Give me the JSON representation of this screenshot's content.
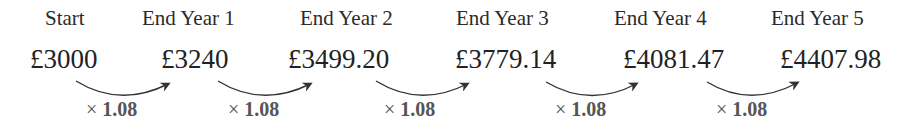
{
  "diagram": {
    "stages": [
      {
        "label": "Start",
        "value": "£3000"
      },
      {
        "label": "End Year 1",
        "value": "£3240"
      },
      {
        "label": "End Year 2",
        "value": "£3499.20"
      },
      {
        "label": "End Year 3",
        "value": "£3779.14"
      },
      {
        "label": "End Year 4",
        "value": "£4081.47"
      },
      {
        "label": "End Year 5",
        "value": "£4407.98"
      }
    ],
    "transitions": [
      {
        "symbol": "×",
        "multiplier": "1.08"
      },
      {
        "symbol": "×",
        "multiplier": "1.08"
      },
      {
        "symbol": "×",
        "multiplier": "1.08"
      },
      {
        "symbol": "×",
        "multiplier": "1.08"
      },
      {
        "symbol": "×",
        "multiplier": "1.08"
      }
    ],
    "colors": {
      "text": "#222222",
      "multiplier": "#555555",
      "arrow": "#333333"
    }
  }
}
